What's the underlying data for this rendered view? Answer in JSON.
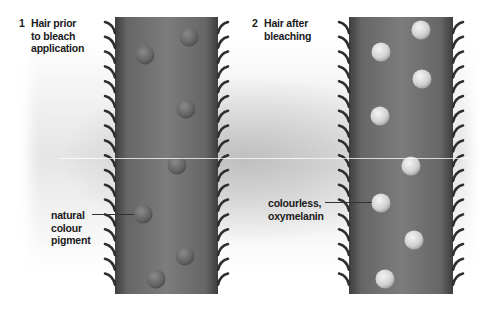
{
  "diagram": {
    "panels": [
      {
        "number": "1",
        "title_lines": [
          "Hair prior",
          "to bleach",
          "application"
        ],
        "annotation_lines": [
          "natural",
          "colour",
          "pigment"
        ],
        "pigment_color": "#6e6e6e",
        "pigments": [
          {
            "x": 145,
            "y": 55
          },
          {
            "x": 189,
            "y": 37
          },
          {
            "x": 186,
            "y": 109
          },
          {
            "x": 177,
            "y": 165
          },
          {
            "x": 143,
            "y": 214
          },
          {
            "x": 185,
            "y": 256
          },
          {
            "x": 156,
            "y": 279
          }
        ]
      },
      {
        "number": "2",
        "title_lines": [
          "Hair after",
          "bleaching"
        ],
        "annotation_lines": [
          "colourless,",
          "oxymelanin"
        ],
        "pigment_color": "#d8d8d8",
        "pigments": [
          {
            "x": 421,
            "y": 30
          },
          {
            "x": 381,
            "y": 52
          },
          {
            "x": 422,
            "y": 79
          },
          {
            "x": 380,
            "y": 116
          },
          {
            "x": 411,
            "y": 166
          },
          {
            "x": 381,
            "y": 203
          },
          {
            "x": 414,
            "y": 240
          },
          {
            "x": 385,
            "y": 279
          }
        ]
      }
    ],
    "colors": {
      "hair_shaft": "#7a7a7a",
      "hair_edge": "#3a3a3a",
      "cuticle_scales": "#2e2e2e",
      "text": "#1a1a1a"
    }
  }
}
